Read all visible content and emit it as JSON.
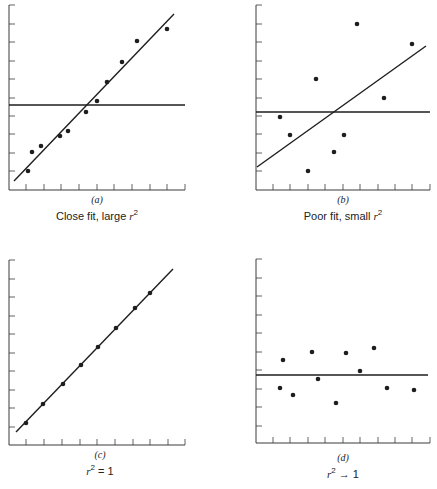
{
  "chart_data": [
    {
      "type": "scatter",
      "panel": "(a)",
      "caption": "Close fit, large r²",
      "caption_text": "Close fit, large ",
      "axes": {
        "x0": 9,
        "y_bottom": 190,
        "y_top": 5,
        "x_right": 185,
        "xticks": [
          26,
          44,
          61,
          79,
          97,
          114,
          132,
          150,
          167,
          185
        ],
        "yticks": [
          5,
          24,
          42,
          61,
          79,
          98,
          116,
          134,
          153,
          171
        ]
      },
      "points": [
        [
          28,
          171
        ],
        [
          32,
          152
        ],
        [
          41,
          146
        ],
        [
          60,
          136
        ],
        [
          68,
          131
        ],
        [
          86,
          112
        ],
        [
          97,
          101
        ],
        [
          107,
          82
        ],
        [
          122,
          62
        ],
        [
          137,
          41
        ],
        [
          167,
          29
        ]
      ],
      "regression_line": [
        [
          14,
          181
        ],
        [
          174,
          14
        ]
      ],
      "mean_line_y": 105,
      "mean_line_x": [
        9,
        185
      ]
    },
    {
      "type": "scatter",
      "panel": "(b)",
      "caption": "Poor fit, small r²",
      "caption_text": "Poor fit, small ",
      "axes": {
        "x0": 256,
        "y_bottom": 190,
        "y_top": 5,
        "x_right": 430,
        "xticks": [
          273,
          290,
          308,
          325,
          343,
          360,
          378,
          395,
          412,
          430
        ],
        "yticks": [
          5,
          24,
          42,
          61,
          79,
          98,
          116,
          134,
          153,
          171
        ]
      },
      "points": [
        [
          280,
          117
        ],
        [
          290,
          135
        ],
        [
          308,
          171
        ],
        [
          316,
          79
        ],
        [
          334,
          152
        ],
        [
          344,
          135
        ],
        [
          357,
          24
        ],
        [
          384,
          98
        ],
        [
          412,
          44
        ]
      ],
      "regression_line": [
        [
          257,
          167
        ],
        [
          426,
          46
        ]
      ],
      "mean_line_y": 112,
      "mean_line_x": [
        256,
        430
      ]
    },
    {
      "type": "scatter",
      "panel": "(c)",
      "caption": "r² = 1",
      "caption_text": " = 1",
      "axes": {
        "x0": 9,
        "y_bottom": 445,
        "y_top": 260,
        "x_right": 185,
        "xticks": [
          26,
          44,
          62,
          80,
          97,
          115,
          133,
          150,
          168,
          185
        ],
        "yticks": [
          260,
          279,
          297,
          316,
          334,
          353,
          371,
          390,
          408,
          427
        ]
      },
      "points": [
        [
          26,
          423
        ],
        [
          43,
          404
        ],
        [
          63,
          384
        ],
        [
          81,
          365
        ],
        [
          98,
          347
        ],
        [
          116,
          328
        ],
        [
          135,
          308
        ],
        [
          150,
          293
        ]
      ],
      "regression_line": [
        [
          16,
          432
        ],
        [
          173,
          269
        ]
      ],
      "mean_line_y": null
    },
    {
      "type": "scatter",
      "panel": "(d)",
      "caption": "r² → 1",
      "caption_text": " → 1",
      "axes": {
        "x0": 256,
        "y_bottom": 443,
        "y_top": 259,
        "x_right": 430,
        "xticks": [
          273,
          290,
          308,
          325,
          343,
          360,
          378,
          395,
          412,
          430
        ],
        "yticks": [
          259,
          278,
          296,
          315,
          333,
          352,
          370,
          389,
          407,
          426
        ]
      },
      "points": [
        [
          280,
          388
        ],
        [
          283,
          360
        ],
        [
          293,
          395
        ],
        [
          312,
          352
        ],
        [
          318,
          379
        ],
        [
          336,
          403
        ],
        [
          346,
          353
        ],
        [
          360,
          371
        ],
        [
          374,
          348
        ],
        [
          387,
          388
        ],
        [
          414,
          390
        ]
      ],
      "regression_line": [
        [
          256,
          375
        ],
        [
          428,
          375
        ]
      ],
      "mean_line_y": 375
    }
  ],
  "labels": {
    "a": {
      "panel": "(a)",
      "caption": "Close fit, large ",
      "sym": "r",
      "sup": "2",
      "tail": ""
    },
    "b": {
      "panel": "(b)",
      "caption": "Poor fit, small ",
      "sym": "r",
      "sup": "2",
      "tail": ""
    },
    "c": {
      "panel": "(c)",
      "caption": "",
      "sym": "r",
      "sup": "2",
      "tail": " = 1"
    },
    "d": {
      "panel": "(d)",
      "caption": "",
      "sym": "r",
      "sup": "2",
      "tail": " → 1"
    }
  },
  "colors": {
    "ink": "#1e1e1e",
    "axis": "#3a3a3a"
  }
}
